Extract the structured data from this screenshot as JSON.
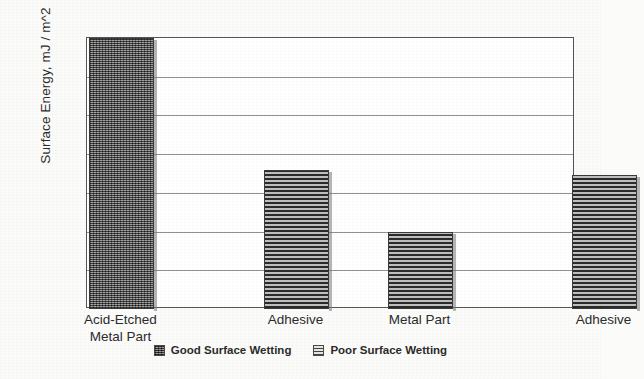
{
  "chart_data": {
    "type": "bar",
    "title": "",
    "xlabel": "",
    "ylabel": "Surface Energy, mJ / m^2",
    "ylim": [
      18.0,
      32.0
    ],
    "ytick_step": 2.0,
    "ytick_labels": [
      "32.0",
      "30.0",
      "28.0",
      "26.0",
      "24.0",
      "22.0",
      "20.0",
      "18.0"
    ],
    "ytick_values": [
      32.0,
      30.0,
      28.0,
      26.0,
      24.0,
      22.0,
      20.0,
      18.0
    ],
    "grid": true,
    "grid_axis": "y",
    "legend_position": "bottom-center",
    "categories": [
      "Acid-Etched Metal Part",
      "Adhesive",
      "Metal Part",
      "Adhesive"
    ],
    "category_lines": [
      [
        "Acid-Etched",
        "Metal Part"
      ],
      [
        "Adhesive"
      ],
      [
        "Metal Part"
      ],
      [
        "Adhesive"
      ]
    ],
    "values": [
      32.0,
      25.2,
      22.0,
      24.9
    ],
    "bars": [
      {
        "category": "Acid-Etched Metal Part",
        "value": 32.0,
        "series": "Good Surface Wetting",
        "pattern": "crosshatch"
      },
      {
        "category": "Adhesive",
        "value": 25.2,
        "series": "Poor Surface Wetting",
        "pattern": "horizontal-lines"
      },
      {
        "category": "Metal Part",
        "value": 22.0,
        "series": "Poor Surface Wetting",
        "pattern": "horizontal-lines"
      },
      {
        "category": "Adhesive",
        "value": 24.9,
        "series": "Poor Surface Wetting",
        "pattern": "horizontal-lines"
      }
    ],
    "legend": [
      {
        "label": "Good Surface Wetting",
        "pattern": "crosshatch"
      },
      {
        "label": "Poor Surface Wetting",
        "pattern": "horizontal-lines"
      }
    ],
    "colors": {
      "bar_fill_dark": "#6f6f6f",
      "bar_fill_light": "#707070",
      "bar_border": "#3a3a3a",
      "gridline": "#6b6b6b",
      "plot_background": "#ffffff",
      "page_background": "#fbfbfa",
      "text": "#2b2b2b"
    }
  }
}
